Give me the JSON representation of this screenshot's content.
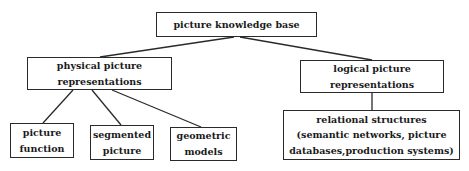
{
  "diagram": {
    "root": {
      "label": "picture knowledge base"
    },
    "physical": {
      "line1": "physical picture",
      "line2": "representations"
    },
    "logical": {
      "line1": "logical picture",
      "line2": "representations"
    },
    "physical_children": [
      {
        "line1": "picture",
        "line2": "function"
      },
      {
        "line1": "segmented",
        "line2": "picture"
      },
      {
        "line1": "geometric",
        "line2": "models"
      }
    ],
    "relational": {
      "line1": "relational structures",
      "line2": "(semantic networks, picture",
      "line3": "databases,production systems)"
    },
    "edges": [
      [
        "picture knowledge base",
        "physical picture representations"
      ],
      [
        "picture knowledge base",
        "logical picture representations"
      ],
      [
        "physical picture representations",
        "picture function"
      ],
      [
        "physical picture representations",
        "segmented picture"
      ],
      [
        "physical picture representations",
        "geometric models"
      ],
      [
        "logical picture representations",
        "relational structures"
      ]
    ]
  }
}
